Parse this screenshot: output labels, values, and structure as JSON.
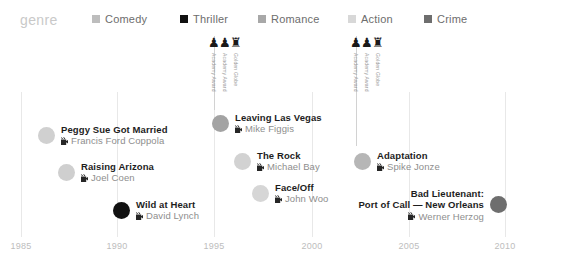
{
  "legend": {
    "title": "genre",
    "items": [
      {
        "label": "Comedy",
        "color": "#bdbdbd",
        "x": 92
      },
      {
        "label": "Thriller",
        "color": "#111111",
        "x": 180
      },
      {
        "label": "Romance",
        "color": "#a8a8a8",
        "x": 258
      },
      {
        "label": "Action",
        "color": "#d8d8d8",
        "x": 348
      },
      {
        "label": "Crime",
        "color": "#6e6e6e",
        "x": 424
      }
    ]
  },
  "axis": {
    "ticks": [
      {
        "label": "1985",
        "x": 21
      },
      {
        "label": "1990",
        "x": 117
      },
      {
        "label": "1995",
        "x": 214
      },
      {
        "label": "2000",
        "x": 312
      },
      {
        "label": "2005",
        "x": 409
      },
      {
        "label": "2010",
        "x": 505
      }
    ],
    "gridlines": [
      21,
      117,
      214,
      312,
      409,
      505
    ]
  },
  "awards": [
    {
      "stem_x": 214,
      "stem_height": 74,
      "trophies": [
        {
          "x": 208,
          "glyph": "♟",
          "label": "Academy Award"
        },
        {
          "x": 219,
          "glyph": "♟",
          "label": "Academy Award"
        },
        {
          "x": 230,
          "glyph": "♜",
          "label": "Golden Globe"
        }
      ]
    },
    {
      "stem_x": 356,
      "stem_height": 110,
      "trophies": [
        {
          "x": 350,
          "glyph": "♟",
          "label": "Academy Award"
        },
        {
          "x": 361,
          "glyph": "♟",
          "label": "Academy Award"
        },
        {
          "x": 372,
          "glyph": "♜",
          "label": "Golden Globe"
        }
      ]
    }
  ],
  "films": [
    {
      "title": "Peggy Sue Got Married",
      "director": "Francis Ford Coppola",
      "color": "#d0d0d0",
      "dot_x": 38,
      "dot_y": 132,
      "side": "right"
    },
    {
      "title": "Raising Arizona",
      "director": "Joel Coen",
      "color": "#cfcfcf",
      "dot_x": 58,
      "dot_y": 169,
      "side": "right"
    },
    {
      "title": "Wild at Heart",
      "director": "David Lynch",
      "color": "#111111",
      "dot_x": 113,
      "dot_y": 207,
      "side": "right"
    },
    {
      "title": "Leaving Las Vegas",
      "director": "Mike Figgis",
      "color": "#a3a3a3",
      "dot_x": 212,
      "dot_y": 120,
      "side": "right"
    },
    {
      "title": "The Rock",
      "director": "Michael Bay",
      "color": "#d2d2d2",
      "dot_x": 234,
      "dot_y": 158,
      "side": "right"
    },
    {
      "title": "Face/Off",
      "director": "John Woo",
      "color": "#d6d6d6",
      "dot_x": 252,
      "dot_y": 190,
      "side": "right"
    },
    {
      "title": "Adaptation",
      "director": "Spike Jonze",
      "color": "#b6b6b6",
      "dot_x": 354,
      "dot_y": 158,
      "side": "right"
    },
    {
      "title": "Bad Lieutenant:",
      "title2": "Port of Call — New Orleans",
      "director": "Werner Herzog",
      "color": "#6e6e6e",
      "dot_x": 490,
      "dot_y": 196,
      "side": "left"
    }
  ],
  "chart_data": {
    "type": "scatter",
    "title": "",
    "xlabel": "",
    "ylabel": "",
    "xlim": [
      1985,
      2010
    ],
    "grid": true,
    "legend_position": "top",
    "legend_title": "genre",
    "categories": [
      "Comedy",
      "Thriller",
      "Romance",
      "Action",
      "Crime"
    ],
    "points": [
      {
        "title": "Peggy Sue Got Married",
        "director": "Francis Ford Coppola",
        "year": 1986,
        "genre": "Comedy"
      },
      {
        "title": "Raising Arizona",
        "director": "Joel Coen",
        "year": 1987,
        "genre": "Comedy"
      },
      {
        "title": "Wild at Heart",
        "director": "David Lynch",
        "year": 1990,
        "genre": "Thriller"
      },
      {
        "title": "Leaving Las Vegas",
        "director": "Mike Figgis",
        "year": 1995,
        "genre": "Romance"
      },
      {
        "title": "The Rock",
        "director": "Michael Bay",
        "year": 1996,
        "genre": "Action"
      },
      {
        "title": "Face/Off",
        "director": "John Woo",
        "year": 1997,
        "genre": "Action"
      },
      {
        "title": "Adaptation",
        "director": "Spike Jonze",
        "year": 2002,
        "genre": "Comedy"
      },
      {
        "title": "Bad Lieutenant: Port of Call — New Orleans",
        "director": "Werner Herzog",
        "year": 2009,
        "genre": "Crime"
      }
    ],
    "annotations": [
      {
        "year": 1995,
        "awards": [
          "Academy Award",
          "Academy Award",
          "Golden Globe"
        ]
      },
      {
        "year": 2002,
        "awards": [
          "Academy Award",
          "Academy Award",
          "Golden Globe"
        ]
      }
    ]
  }
}
